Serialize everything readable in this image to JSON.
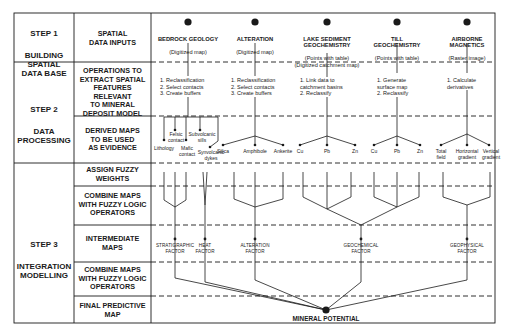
{
  "steps": [
    {
      "number": "STEP 1",
      "name": "BUILDING\nSPATIAL\nDATA BASE"
    },
    {
      "number": "STEP 2",
      "name": "DATA\nPROCESSING"
    },
    {
      "number": "STEP 3",
      "name": "INTEGRATION\nMODELLING"
    }
  ],
  "rows": [
    "SPATIAL\nDATA INPUTS",
    "OPERATIONS TO\nEXTRACT SPATIAL\nFEATURES\nRELEVANT\nTO MINERAL\nDEPOSIT MODEL",
    "DERIVED MAPS\nTO BE USED\nAS EVIDENCE",
    "ASSIGN FUZZY\nWEIGHTS",
    "COMBINE MAPS\nWITH FUZZY LOGIC\nOPERATORS",
    "INTERMEDIATE\nMAPS",
    "COMBINE MAPS\nWITH FUZZY LOGIC\nOPERATORS",
    "FINAL PREDICTIVE\nMAP"
  ],
  "inputs": [
    {
      "title": "BEDROCK GEOLOGY",
      "subtitle": "(Digitized map)"
    },
    {
      "title": "ALTERATION",
      "subtitle": "(Digitized map)"
    },
    {
      "title": "LAKE SEDIMENT\nGEOCHEMISTRY",
      "subtitle": "(Points with table)\n(Digitized catchment map)"
    },
    {
      "title": "TILL\nGEOCHEMISTRY",
      "subtitle": "(Points with table)"
    },
    {
      "title": "AIRBORNE\nMAGNETICS",
      "subtitle": "(Raster image)"
    }
  ],
  "operations": [
    "1. Reclassification\n2. Select contacts\n3. Create buffers",
    "1. Reclassification\n2. Select contacts\n3. Create buffers",
    "1. Link data to\n    catchment basins\n2. Reclassify",
    "1. Generate\n    surface map\n2. Reclassify",
    "1. Calculate\n    derivatives"
  ],
  "evidence": {
    "geology": [
      "Lithology",
      "Felsic\ncontact",
      "Mafic\ncontact",
      "Subvolcanic\nsills",
      "Synvolcanic\ndykes"
    ],
    "alteration": [
      "Silica",
      "Amphibole",
      "Ankerite"
    ],
    "lake": [
      "Cu",
      "Pb",
      "Zn"
    ],
    "till": [
      "Cu",
      "Pb",
      "Zn"
    ],
    "magnetics": [
      "Total\nfield",
      "Horizontal\ngradient",
      "Vertical\ngradient"
    ]
  },
  "factors": [
    "STRATIGRAPHIC\nFACTOR",
    "HEAT\nFACTOR",
    "ALTERATION\nFACTOR",
    "GEOCHEMICAL\nFACTOR",
    "GEOPHYSICAL\nFACTOR"
  ],
  "final_output": "MINERAL POTENTIAL",
  "colors": {
    "line": "#1a1a1a",
    "background": "#ffffff"
  }
}
